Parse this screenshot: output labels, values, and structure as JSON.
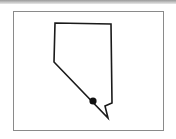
{
  "map": {
    "region": "Nevada",
    "outline_color": "#1a1a1a",
    "marker": {
      "label": "Las Vegas",
      "color": "#111111"
    },
    "frame_color": "#8a8a8a"
  }
}
